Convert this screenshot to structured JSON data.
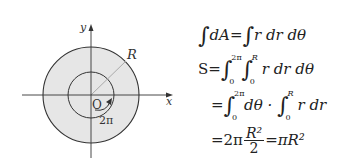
{
  "diagram": {
    "axis_x_label": "x",
    "axis_y_label": "y",
    "origin_label": "O",
    "radius_label": "R",
    "angle_label": "2π",
    "colors": {
      "fill": "#e6e6e6",
      "stroke": "#333333",
      "radius_line": "#aaaaaa"
    }
  },
  "equations": {
    "line1": {
      "lhs_int": "∫",
      "lhs": "dA",
      "eq": "=",
      "rhs_int": "∫",
      "rhs": "r dr dθ"
    },
    "line2": {
      "lhs": "S",
      "eq": "=",
      "int1_hi": "2π",
      "int1_lo": "0",
      "int2_hi": "R",
      "int2_lo": "0",
      "integrand": "r dr dθ"
    },
    "line3": {
      "eq": "=",
      "int1_hi": "2π",
      "int1_lo": "0",
      "part1": "dθ ·",
      "int2_hi": "R",
      "int2_lo": "0",
      "part2": "r dr"
    },
    "line4": {
      "eq": "=",
      "coef": "2π",
      "num": "R²",
      "den": "2",
      "eq2": "=",
      "result": "πR²"
    }
  }
}
